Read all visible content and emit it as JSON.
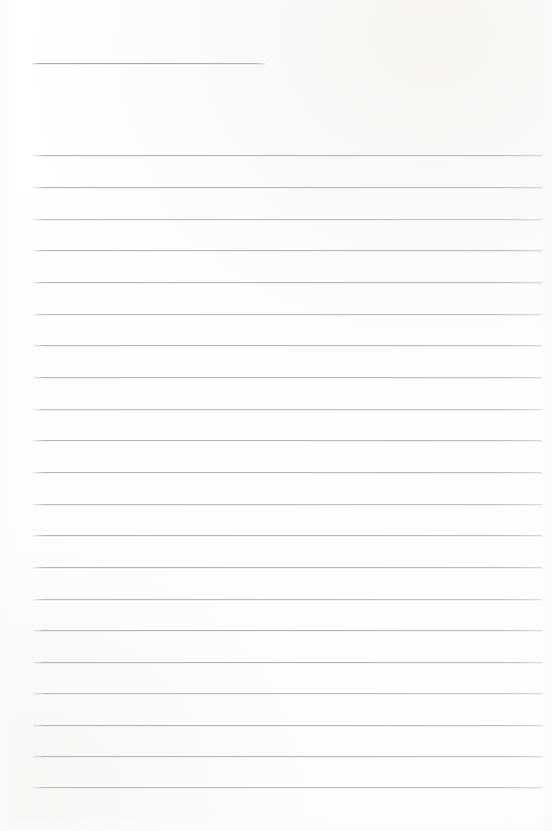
{
  "document": {
    "kind": "scanned-blank-ruled-paper",
    "page_width": 552,
    "page_height": 831,
    "background_color": "#ffffff",
    "has_visible_text": false,
    "text_content": "",
    "orientation": "portrait"
  },
  "header_rule": {
    "name": "title-underline",
    "x_start": 32,
    "x_end": 265,
    "y": 63,
    "thickness": 1,
    "color": "#a9adb0"
  },
  "ruling": {
    "line_count": 21,
    "x_start": 33,
    "x_end": 542,
    "first_line_y": 155,
    "line_spacing": 31.6,
    "thickness": 1,
    "color": "#b4b8bb",
    "lines": [
      {
        "index": 1,
        "y": 155
      },
      {
        "index": 2,
        "y": 187
      },
      {
        "index": 3,
        "y": 219
      },
      {
        "index": 4,
        "y": 250
      },
      {
        "index": 5,
        "y": 282
      },
      {
        "index": 6,
        "y": 314
      },
      {
        "index": 7,
        "y": 345
      },
      {
        "index": 8,
        "y": 377
      },
      {
        "index": 9,
        "y": 409
      },
      {
        "index": 10,
        "y": 440
      },
      {
        "index": 11,
        "y": 472
      },
      {
        "index": 12,
        "y": 504
      },
      {
        "index": 13,
        "y": 535
      },
      {
        "index": 14,
        "y": 567
      },
      {
        "index": 15,
        "y": 599
      },
      {
        "index": 16,
        "y": 630
      },
      {
        "index": 17,
        "y": 662
      },
      {
        "index": 18,
        "y": 693
      },
      {
        "index": 19,
        "y": 725
      },
      {
        "index": 20,
        "y": 756
      },
      {
        "index": 21,
        "y": 787
      }
    ]
  }
}
